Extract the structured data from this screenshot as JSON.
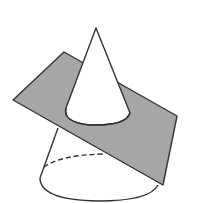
{
  "diagram": {
    "colors": {
      "background": "#ffffff",
      "stroke": "#333333",
      "plane_fill": "#a6a6a6",
      "cone_fill": "#ffffff"
    },
    "elements": [
      "cone",
      "cutting-plane",
      "cut-curve",
      "base-ellipse",
      "hidden-base-edge"
    ]
  }
}
